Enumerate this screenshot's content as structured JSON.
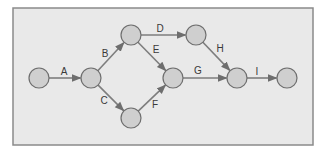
{
  "diagram": {
    "type": "activity-on-arrow network",
    "colors": {
      "background": "#e9e9e9",
      "frame": "#8a8a8a",
      "node_fill": "#cfcfcf",
      "node_stroke": "#6e6e6e",
      "edge": "#7d7d7d",
      "label": "#3a3a3a"
    },
    "nodes": [
      {
        "id": "n1",
        "x": 39,
        "y": 78
      },
      {
        "id": "n2",
        "x": 91,
        "y": 78
      },
      {
        "id": "n3",
        "x": 131,
        "y": 35
      },
      {
        "id": "n4",
        "x": 131,
        "y": 118
      },
      {
        "id": "n5",
        "x": 173,
        "y": 78
      },
      {
        "id": "n6",
        "x": 196,
        "y": 35
      },
      {
        "id": "n7",
        "x": 237,
        "y": 78
      },
      {
        "id": "n8",
        "x": 287,
        "y": 78
      }
    ],
    "edges": [
      {
        "label": "A",
        "from": "n1",
        "to": "n2",
        "lx": 64,
        "ly": 72
      },
      {
        "label": "B",
        "from": "n2",
        "to": "n3",
        "lx": 105,
        "ly": 54
      },
      {
        "label": "C",
        "from": "n2",
        "to": "n4",
        "lx": 104,
        "ly": 101
      },
      {
        "label": "D",
        "from": "n3",
        "to": "n6",
        "lx": 160,
        "ly": 29
      },
      {
        "label": "E",
        "from": "n3",
        "to": "n5",
        "lx": 156,
        "ly": 50
      },
      {
        "label": "F",
        "from": "n4",
        "to": "n5",
        "lx": 155,
        "ly": 105
      },
      {
        "label": "G",
        "from": "n5",
        "to": "n7",
        "lx": 198,
        "ly": 71
      },
      {
        "label": "H",
        "from": "n6",
        "to": "n7",
        "lx": 220,
        "ly": 49
      },
      {
        "label": "I",
        "from": "n7",
        "to": "n8",
        "lx": 257,
        "ly": 72
      }
    ]
  }
}
